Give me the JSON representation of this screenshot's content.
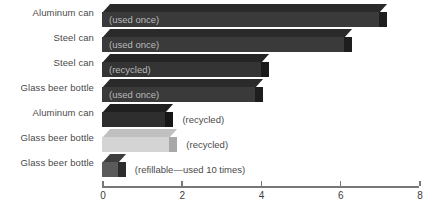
{
  "chart_data": {
    "type": "bar",
    "orientation": "horizontal",
    "title": "",
    "xlabel": "",
    "ylabel": "",
    "xlim": [
      0,
      8
    ],
    "grid": false,
    "legend": "none",
    "tick_labels": [
      "0",
      "2",
      "4",
      "6",
      "8"
    ],
    "tick_values": [
      0,
      2,
      4,
      6,
      8
    ],
    "categories": [
      "Aluminum can",
      "Steel can",
      "Steel can",
      "Glass beer bottle",
      "Aluminum can",
      "Glass beer bottle",
      "Glass beer bottle"
    ],
    "annotations": [
      "(used once)",
      "(used once)",
      "(recycled)",
      "(used once)",
      "(recycled)",
      "(recycled)",
      "(refillable—used 10 times)"
    ],
    "values": [
      7.0,
      6.1,
      4.0,
      3.85,
      1.6,
      1.7,
      0.4
    ],
    "bars": [
      {
        "category": "Aluminum can",
        "annotation": "(used once)",
        "annotation_position": "inside",
        "value": 7.0,
        "color": "#3a3a3a",
        "top_color": "#2a2a2a",
        "side_color": "#1e1e1e"
      },
      {
        "category": "Steel can",
        "annotation": "(used once)",
        "annotation_position": "inside",
        "value": 6.1,
        "color": "#3a3a3a",
        "top_color": "#2a2a2a",
        "side_color": "#1e1e1e"
      },
      {
        "category": "Steel can",
        "annotation": "(recycled)",
        "annotation_position": "inside",
        "value": 4.0,
        "color": "#343434",
        "top_color": "#242424",
        "side_color": "#1a1a1a"
      },
      {
        "category": "Glass beer bottle",
        "annotation": "(used once)",
        "annotation_position": "inside",
        "value": 3.85,
        "color": "#3a3a3a",
        "top_color": "#2a2a2a",
        "side_color": "#1e1e1e"
      },
      {
        "category": "Aluminum can",
        "annotation": "(recycled)",
        "annotation_position": "outside",
        "value": 1.6,
        "color": "#2e2e2e",
        "top_color": "#1f1f1f",
        "side_color": "#161616"
      },
      {
        "category": "Glass beer bottle",
        "annotation": "(recycled)",
        "annotation_position": "outside",
        "value": 1.7,
        "color": "#d4d4d4",
        "top_color": "#c0c0c0",
        "side_color": "#a8a8a8"
      },
      {
        "category": "Glass beer bottle",
        "annotation": "(refillable—used 10 times)",
        "annotation_position": "outside",
        "value": 0.4,
        "color": "#5a5a5a",
        "top_color": "#3d3d3d",
        "side_color": "#2c2c2c"
      }
    ]
  }
}
